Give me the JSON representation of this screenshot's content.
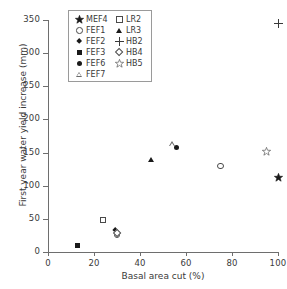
{
  "chart_data": {
    "type": "scatter",
    "title": "",
    "xlabel": "Basal area cut (%)",
    "ylabel": "First year water yield increase (mm)",
    "xlim": [
      0,
      100
    ],
    "ylim": [
      0,
      350
    ],
    "xticks": [
      0,
      20,
      40,
      60,
      80,
      100
    ],
    "yticks": [
      0,
      50,
      100,
      150,
      200,
      250,
      300,
      350
    ],
    "grid": false,
    "legend_position": "top-left-inside",
    "series": [
      {
        "name": "MEF4",
        "marker": "star-filled",
        "points": [
          {
            "x": 100,
            "y": 112
          }
        ]
      },
      {
        "name": "FEF1",
        "marker": "circle-open",
        "points": [
          {
            "x": 30,
            "y": 26
          },
          {
            "x": 75,
            "y": 130
          }
        ]
      },
      {
        "name": "FEF2",
        "marker": "diamond-filled",
        "points": [
          {
            "x": 29,
            "y": 33
          }
        ]
      },
      {
        "name": "FEF3",
        "marker": "square-filled",
        "points": [
          {
            "x": 13,
            "y": 10
          }
        ]
      },
      {
        "name": "FEF6",
        "marker": "circle-filled",
        "points": [
          {
            "x": 56,
            "y": 158
          }
        ]
      },
      {
        "name": "FEF7",
        "marker": "triangle-open",
        "points": [
          {
            "x": 54,
            "y": 163
          }
        ]
      },
      {
        "name": "LR2",
        "marker": "square-open",
        "points": [
          {
            "x": 24,
            "y": 48
          }
        ]
      },
      {
        "name": "LR3",
        "marker": "triangle-filled",
        "points": [
          {
            "x": 45,
            "y": 140
          }
        ]
      },
      {
        "name": "HB2",
        "marker": "plus",
        "points": [
          {
            "x": 100,
            "y": 345
          }
        ]
      },
      {
        "name": "HB4",
        "marker": "diamond-open",
        "points": [
          {
            "x": 30,
            "y": 28
          }
        ]
      },
      {
        "name": "HB5",
        "marker": "star-open",
        "points": [
          {
            "x": 95,
            "y": 152
          }
        ]
      }
    ]
  },
  "legend": {
    "left_column": [
      {
        "label": "MEF4",
        "marker": "star-filled"
      },
      {
        "label": "FEF1",
        "marker": "circle-open"
      },
      {
        "label": "FEF2",
        "marker": "diamond-filled"
      },
      {
        "label": "FEF3",
        "marker": "square-filled"
      },
      {
        "label": "FEF6",
        "marker": "circle-filled"
      },
      {
        "label": "FEF7",
        "marker": "triangle-open"
      }
    ],
    "right_column": [
      {
        "label": "LR2",
        "marker": "square-open"
      },
      {
        "label": "LR3",
        "marker": "triangle-filled"
      },
      {
        "label": "HB2",
        "marker": "plus"
      },
      {
        "label": "HB4",
        "marker": "diamond-open"
      },
      {
        "label": "HB5",
        "marker": "star-open"
      }
    ]
  },
  "colors": {
    "marker_fill": "#1a1a1a",
    "marker_stroke": "#4a4a4a",
    "axis": "#6e6e6e",
    "text": "#3a3a3a",
    "background": "#ffffff"
  }
}
